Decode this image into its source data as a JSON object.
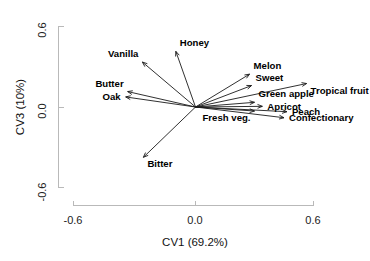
{
  "chart_data": {
    "type": "scatter",
    "plot_kind": "biplot-loadings",
    "title": "",
    "subtitle": "",
    "xlabel": "CV1 (69.2%)",
    "ylabel": "CV3 (10%)",
    "xlim": [
      -0.75,
      0.72
    ],
    "ylim": [
      -0.78,
      0.72
    ],
    "xticks": [
      -0.6,
      0.0,
      0.6
    ],
    "xtick_labels": [
      "-0.6",
      "0.0",
      "0.6"
    ],
    "yticks": [
      0.6,
      0.0,
      -0.6
    ],
    "ytick_labels": [
      "0.6",
      "0.0",
      "-0.6"
    ],
    "grid": false,
    "legend": "none",
    "origin": [
      0.0,
      0.0
    ],
    "vectors": [
      {
        "label": "Vanilla",
        "x": -0.27,
        "y": 0.335,
        "label_pos": "above-left"
      },
      {
        "label": "Honey",
        "x": -0.1,
        "y": 0.415,
        "label_pos": "above-right"
      },
      {
        "label": "Butter",
        "x": -0.345,
        "y": 0.115,
        "label_pos": "above-left"
      },
      {
        "label": "Oak",
        "x": -0.355,
        "y": 0.075,
        "label_pos": "left"
      },
      {
        "label": "Bitter",
        "x": -0.265,
        "y": -0.375,
        "label_pos": "below-right"
      },
      {
        "label": "Melon",
        "x": 0.275,
        "y": 0.245,
        "label_pos": "above-right"
      },
      {
        "label": "Sweet",
        "x": 0.285,
        "y": 0.16,
        "label_pos": "above-right"
      },
      {
        "label": "Tropical fruit",
        "x": 0.565,
        "y": 0.175,
        "label_pos": "below-right"
      },
      {
        "label": "Green apple",
        "x": 0.3,
        "y": 0.035,
        "label_pos": "above-right"
      },
      {
        "label": "Apricot",
        "x": 0.34,
        "y": 0.005,
        "label_pos": "right"
      },
      {
        "label": "Fresh veg.",
        "x": 0.3,
        "y": -0.03,
        "label_pos": "below-left"
      },
      {
        "label": "Peach",
        "x": 0.465,
        "y": -0.035,
        "label_pos": "right"
      },
      {
        "label": "Confectionary",
        "x": 0.45,
        "y": -0.08,
        "label_pos": "right"
      }
    ]
  },
  "axes": {
    "x_title": "CV1 (69.2%)",
    "y_title": "CV3 (10%)",
    "x_ticks": [
      "-0.6",
      "0.0",
      "0.6"
    ],
    "y_ticks": [
      "0.6",
      "0.0",
      "-0.6"
    ]
  },
  "labels": {
    "vanilla": "Vanilla",
    "honey": "Honey",
    "butter": "Butter",
    "oak": "Oak",
    "bitter": "Bitter",
    "melon": "Melon",
    "sweet": "Sweet",
    "tropical_fruit": "Tropical fruit",
    "green_apple": "Green apple",
    "apricot": "Apricot",
    "fresh_veg": "Fresh veg.",
    "peach": "Peach",
    "confectionary": "Confectionary"
  },
  "colors": {
    "background": "#ffffff",
    "axis": "#b9b9b9",
    "vector": "#1a1a1a",
    "text": "#000000"
  }
}
